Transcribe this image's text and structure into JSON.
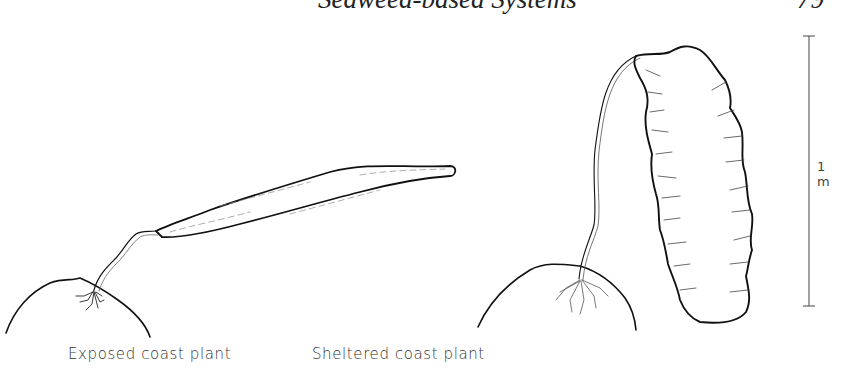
{
  "header": {
    "running_title": "Seaweed-based Systems",
    "page_number": "79"
  },
  "figure": {
    "panels": [
      {
        "id": "exposed",
        "caption": "Exposed coast plant"
      },
      {
        "id": "sheltered",
        "caption": "Sheltered coast plant"
      }
    ],
    "scale_bar": {
      "label": "1 m"
    }
  }
}
